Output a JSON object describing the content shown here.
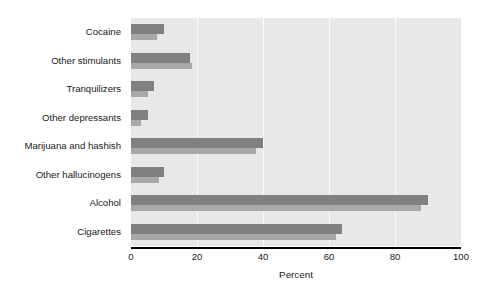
{
  "chart_data": {
    "type": "bar",
    "orientation": "horizontal",
    "title": "",
    "xlabel": "Percent",
    "ylabel": "",
    "xlim": [
      0,
      100
    ],
    "xticks": [
      0,
      20,
      40,
      60,
      80,
      100
    ],
    "xtick_labels": [
      "0",
      "20",
      "40",
      "60",
      "80",
      "100"
    ],
    "grid": true,
    "grid_axis": "x",
    "legend": null,
    "categories": [
      "Cocaine",
      "Other stimulants",
      "Tranquilizers",
      "Other depressants",
      "Marijuana and hashish",
      "Other hallucinogens",
      "Alcohol",
      "Cigarettes"
    ],
    "series": [
      {
        "name": "series-1",
        "color": "#808080",
        "values": [
          10,
          18,
          7,
          5,
          40,
          10,
          90,
          64
        ]
      },
      {
        "name": "series-2",
        "color": "#a8a8a8",
        "values": [
          8,
          18.5,
          5,
          3,
          38,
          8.5,
          88,
          62
        ]
      }
    ]
  },
  "style": {
    "plot_background": "#e8e8e8",
    "page_background": "#ffffff",
    "gridline_color": "#fbfbfb",
    "axis_color": "#000000",
    "text_color": "#1a1a1a"
  }
}
